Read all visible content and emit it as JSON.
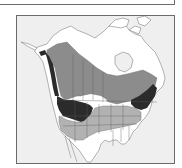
{
  "figure": {
    "type": "range-map",
    "region": "North America",
    "colors": {
      "ocean": "#efefef",
      "land": "#ffffff",
      "border": "#6b6b6b",
      "range_medium": "#8c8c8c",
      "range_light": "#b2b2b2",
      "range_dark": "#2b2b2b"
    },
    "legend_categories": [
      {
        "name": "medium-gray-range",
        "color": "#8c8c8c"
      },
      {
        "name": "light-gray-range",
        "color": "#b2b2b2"
      },
      {
        "name": "dark-range",
        "color": "#2b2b2b"
      }
    ]
  }
}
